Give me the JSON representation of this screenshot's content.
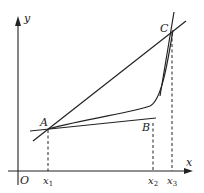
{
  "figure": {
    "type": "function-graph-with-secant-and-tangent",
    "axes": {
      "x_label": "x",
      "y_label": "y",
      "origin_label": "O"
    },
    "points": [
      {
        "name": "A",
        "label": "A"
      },
      {
        "name": "B",
        "label": "B"
      },
      {
        "name": "C",
        "label": "C"
      }
    ],
    "ticks": [
      {
        "label": "x",
        "sub": "1"
      },
      {
        "label": "x",
        "sub": "2"
      },
      {
        "label": "x",
        "sub": "3"
      }
    ],
    "elements": [
      "convex curve through A, B, C",
      "line through A and C",
      "line through A and B",
      "tangent line at C",
      "dashed vertical projections from A, B, C to x-axis"
    ],
    "colors": {
      "stroke": "#222222",
      "background": "#ffffff"
    }
  }
}
